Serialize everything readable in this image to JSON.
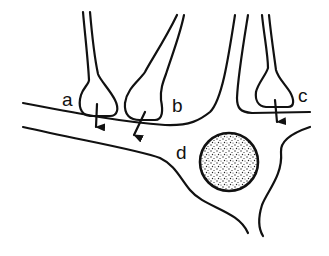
{
  "diagram": {
    "labels": {
      "a": "a",
      "b": "b",
      "c": "c",
      "d": "d"
    },
    "elements": [
      {
        "id": "a",
        "description": "axon terminal synapsing on dendrite (arrow indicates transmission)"
      },
      {
        "id": "b",
        "description": "axon terminal synapsing on dendrite (arrow indicates transmission)"
      },
      {
        "id": "c",
        "description": "axon terminal synapsing on cell body (arrow indicates transmission)"
      },
      {
        "id": "d",
        "description": "cell body with stippled nucleus"
      }
    ],
    "colors": {
      "stroke": "#111111",
      "background": "#ffffff"
    }
  }
}
